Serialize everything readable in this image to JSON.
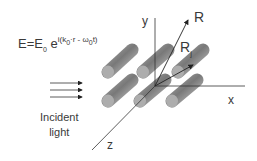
{
  "formula": {
    "lhs": "E=E",
    "lhs_sub": "0",
    "base": " e",
    "exp_open": "i(k",
    "exp_k_sub": "0",
    "exp_mid": "·r - ω",
    "exp_w_sub": "0",
    "exp_close": "t)"
  },
  "incident": {
    "line1": "Incident",
    "line2": "light"
  },
  "axes": {
    "x": "x",
    "y": "y",
    "z": "z"
  },
  "vectors": {
    "r": "R",
    "rj": "R",
    "rj_sub": "j"
  },
  "colors": {
    "axis": "#333333",
    "cylinder_dark": "#6e6e6e",
    "cylinder_light": "#b8b8b8"
  }
}
